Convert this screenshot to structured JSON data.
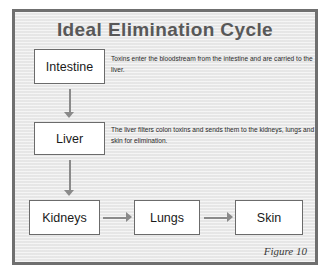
{
  "figure": {
    "title": "Ideal Elimination Cycle",
    "caption": "Figure 10",
    "frame_color": "#6f6f6f",
    "background_color": "#e9e9e9",
    "title_color": "#585858",
    "box_border_color": "#6b6b6b",
    "box_fill_color": "#ffffff",
    "arrow_color": "#8a8a8a"
  },
  "boxes": [
    {
      "id": "intestine",
      "label": "Intestine"
    },
    {
      "id": "liver",
      "label": "Liver"
    },
    {
      "id": "kidneys",
      "label": "Kidneys"
    },
    {
      "id": "lungs",
      "label": "Lungs"
    },
    {
      "id": "skin",
      "label": "Skin"
    }
  ],
  "descriptions": [
    {
      "id": "intestine-note",
      "text": "Toxins enter the bloodstream from the intestine and are carried to the liver."
    },
    {
      "id": "liver-note",
      "text": "The liver filters colon toxins and sends them to the kidneys, lungs and skin for elimination."
    }
  ],
  "arrows": [
    {
      "id": "intestine-to-liver",
      "direction": "down",
      "from": "Intestine",
      "to": "Liver"
    },
    {
      "id": "liver-to-kidneys",
      "direction": "down",
      "from": "Liver",
      "to": "Kidneys"
    },
    {
      "id": "kidneys-to-lungs",
      "direction": "right",
      "from": "Kidneys",
      "to": "Lungs"
    },
    {
      "id": "lungs-to-skin",
      "direction": "right",
      "from": "Lungs",
      "to": "Skin"
    }
  ]
}
